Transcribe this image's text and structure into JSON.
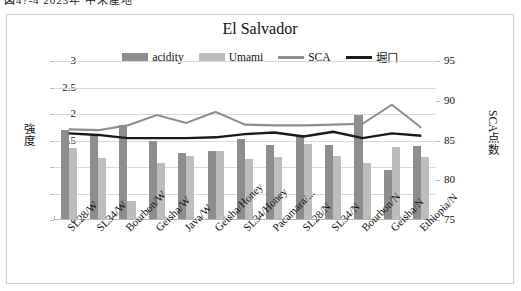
{
  "top_strip": {
    "partial_text": "図4?-4  2023年  中米産地"
  },
  "chart_data": {
    "type": "bar",
    "title": "El Salvador",
    "xlabel": "",
    "ylabel": "強度",
    "y2label": "SCA点数",
    "ylim": [
      0,
      3
    ],
    "y2lim": [
      75,
      95
    ],
    "yticks": [
      "0",
      "0.5",
      "1",
      "1.5",
      "2",
      "2.5",
      "3"
    ],
    "y2ticks": [
      "75",
      "80",
      "85",
      "90",
      "95"
    ],
    "grid": true,
    "legend_position": "top-center",
    "categories": [
      "SL28/W",
      "SL34/W",
      "Bourbon/W",
      "Geisha/W",
      "Java/W",
      "Geisha/Honey",
      "SL34/Honey",
      "Pacamara/...",
      "SL28/N",
      "SL34/N",
      "Bourbon/N",
      "Geisha/N",
      "Ethiopia/N"
    ],
    "series": [
      {
        "name": "acidity",
        "type": "bar",
        "axis": "left",
        "color": "#8d8d8d",
        "values": [
          1.7,
          1.62,
          1.8,
          1.5,
          1.27,
          1.31,
          1.52,
          1.42,
          1.6,
          1.41,
          1.98,
          0.95,
          1.39
        ]
      },
      {
        "name": "Umami",
        "type": "bar",
        "axis": "left",
        "color": "#bdbdbd",
        "values": [
          1.36,
          1.17,
          0.36,
          1.07,
          1.21,
          1.3,
          1.15,
          1.19,
          1.43,
          1.2,
          1.08,
          1.38,
          1.19
        ]
      },
      {
        "name": "SCA",
        "type": "line",
        "axis": "right",
        "color": "#8d8d8d",
        "values": [
          86.4,
          86.3,
          86.9,
          88.2,
          87.2,
          88.6,
          87.0,
          86.9,
          86.9,
          87.0,
          87.1,
          89.5,
          86.6
        ]
      },
      {
        "name": "堀口",
        "type": "line",
        "axis": "right",
        "color": "#1a1a1a",
        "values": [
          85.9,
          85.7,
          85.3,
          85.3,
          85.3,
          85.4,
          85.8,
          86.0,
          85.5,
          86.1,
          85.3,
          85.9,
          85.6
        ]
      }
    ]
  }
}
